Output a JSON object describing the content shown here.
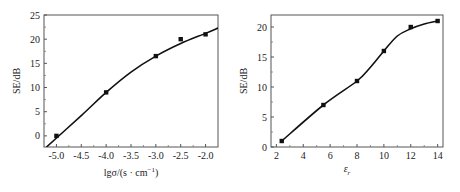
{
  "chart_data": [
    {
      "type": "line",
      "title": "",
      "xlabel": "lgσ/(s·cm⁻¹)",
      "ylabel": "SE/dB",
      "xlim": [
        -5.25,
        -1.75
      ],
      "ylim": [
        -2.3,
        25
      ],
      "xticks": [
        "-5.0",
        "-4.5",
        "-4.0",
        "-3.5",
        "-3.0",
        "-2.5",
        "-2.0"
      ],
      "yticks": [
        "0",
        "5",
        "10",
        "15",
        "20",
        "25"
      ],
      "grid": false,
      "series": [
        {
          "name": "measured",
          "marker": "square",
          "x": [
            -5.0,
            -4.0,
            -3.0,
            -2.5,
            -2.0
          ],
          "y": [
            0,
            9,
            16.5,
            20,
            21
          ]
        },
        {
          "name": "fit",
          "marker": "none",
          "x": [
            -5.2,
            -4.5,
            -4.0,
            -3.5,
            -3.0,
            -2.5,
            -2.0,
            -1.75
          ],
          "y": [
            -2.3,
            4.2,
            9.0,
            13.2,
            16.5,
            19.1,
            21.2,
            22.3
          ]
        }
      ]
    },
    {
      "type": "line",
      "title": "",
      "xlabel": "εr",
      "ylabel": "SE/dB",
      "xlim": [
        1.6,
        14.4
      ],
      "ylim": [
        0,
        22
      ],
      "xticks": [
        "2",
        "4",
        "6",
        "8",
        "10",
        "12",
        "14"
      ],
      "yticks": [
        "0",
        "5",
        "10",
        "15",
        "20"
      ],
      "grid": false,
      "series": [
        {
          "name": "measured",
          "marker": "square",
          "x": [
            2.4,
            5.5,
            8,
            10,
            12,
            14
          ],
          "y": [
            1,
            7,
            11,
            16,
            20,
            21
          ]
        },
        {
          "name": "fit",
          "marker": "none",
          "x": [
            2.4,
            5.5,
            8,
            9,
            10,
            11,
            12,
            13,
            14
          ],
          "y": [
            1,
            7,
            11,
            13.3,
            16,
            18.5,
            19.7,
            20.5,
            21
          ]
        }
      ]
    }
  ],
  "left": {
    "ylabel": "SE/dB",
    "xlabel_main": "lgσ/(s · cm",
    "xlabel_sup": "−1",
    "xlabel_end": ")"
  },
  "right": {
    "ylabel": "SE/dB",
    "xlabel_main": "ε",
    "xlabel_sub": "r"
  }
}
